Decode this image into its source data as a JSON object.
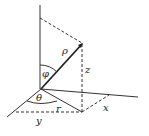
{
  "diagram": {
    "type": "spherical-coordinates",
    "labels": {
      "rho": "ρ",
      "phi": "φ",
      "theta": "θ",
      "z": "z",
      "r": "r",
      "x": "x",
      "y": "y"
    },
    "colors": {
      "line": "#222222",
      "background": "#ffffff"
    }
  }
}
